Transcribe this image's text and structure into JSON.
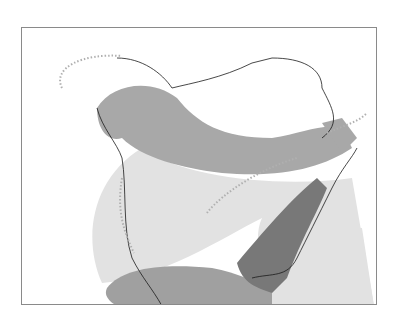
{
  "map": {
    "type": "species range map",
    "region": "North America",
    "frame": {
      "border_color": "#8a8a8a"
    },
    "legend_colors": {
      "breeding": "#a8a8a8",
      "year_round": "#787878",
      "winter": "#a0a0a0",
      "migration": "#e2e2e2",
      "rare_boundary": "#b0b0b0",
      "coastline": "#1a1a1a",
      "land": "#ffffff"
    },
    "zones": [
      {
        "name": "breeding-range",
        "description": "Alaska through central Canada to Newfoundland"
      },
      {
        "name": "migration-range",
        "description": "Western and central US, Great Plains, Atlantic offshore"
      },
      {
        "name": "year-round-range",
        "description": "Southeastern US, Appalachians to mid-Atlantic"
      },
      {
        "name": "winter-range",
        "description": "Mexico, Texas, Gulf Coast"
      },
      {
        "name": "rare-occurrence-boundary",
        "description": "Dotted outline: western Alaska, Greenland coast, Pacific coast, Great Lakes"
      }
    ]
  }
}
